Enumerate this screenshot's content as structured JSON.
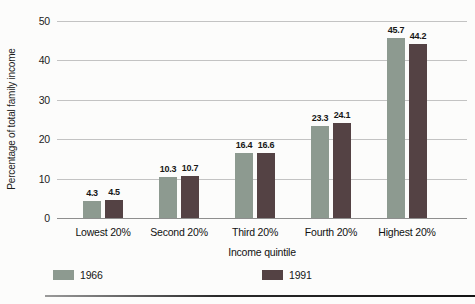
{
  "chart_data": {
    "type": "bar",
    "title": "",
    "categories": [
      "Lowest 20%",
      "Second 20%",
      "Third 20%",
      "Fourth 20%",
      "Highest 20%"
    ],
    "series": [
      {
        "name": "1966",
        "color": "#8d9a90",
        "values": [
          4.3,
          10.3,
          16.4,
          23.3,
          45.7
        ]
      },
      {
        "name": "1991",
        "color": "#544244",
        "values": [
          4.5,
          10.7,
          16.6,
          24.1,
          44.2
        ]
      }
    ],
    "xlabel": "Income quintile",
    "ylabel": "Percentage of total family income",
    "ylim": [
      0,
      50
    ],
    "yticks": [
      0,
      10,
      20,
      30,
      40,
      50
    ],
    "grid": true,
    "legend_position": "bottom",
    "colors": {
      "gridline": "#c3c3c3",
      "axis": "#8e8e8e",
      "text": "#1c1c1c"
    }
  }
}
